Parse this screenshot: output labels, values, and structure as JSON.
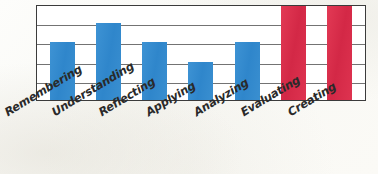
{
  "chart_data": {
    "type": "bar",
    "title": "",
    "subtitle": "",
    "xlabel": "",
    "ylabel": "",
    "categories": [
      "Remembering",
      "Understanding",
      "Reflecting",
      "Applying",
      "Analyzing",
      "Evaluating",
      "Creating"
    ],
    "values": [
      3,
      4,
      3,
      2,
      3,
      5,
      5
    ],
    "bar_colors": [
      "#3a8fd0",
      "#3a8fd0",
      "#3a8fd0",
      "#3a8fd0",
      "#3a8fd0",
      "#e0304f",
      "#e0304f"
    ],
    "ylim": [
      0,
      5
    ],
    "yticks": [
      0,
      1,
      2,
      3,
      4,
      5
    ],
    "ytick_labels": [
      "",
      "",
      "",
      "",
      "",
      ""
    ],
    "grid": true,
    "grid_orientation": "horizontal",
    "legend": null,
    "legend_position": "none",
    "annotations": [],
    "series": [
      {
        "name": "",
        "values": [
          3,
          4,
          3,
          2,
          3,
          5,
          5
        ]
      }
    ]
  },
  "colors": {
    "bar_blue": "#3a8fd0",
    "bar_red": "#e0304f",
    "frame": "#3b3b3b",
    "gridline": "#5a5a5a",
    "paper": "#fbfaf6",
    "label_text": "#2a2a2a"
  },
  "axis": {
    "gridline_count": 5,
    "frame_visible": true
  }
}
